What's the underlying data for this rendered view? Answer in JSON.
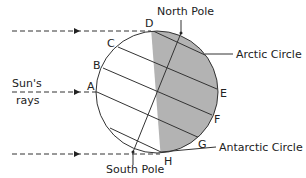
{
  "diagram": {
    "labels": {
      "north_pole": "North Pole",
      "south_pole": "South Pole",
      "arctic_circle": "Arctic Circle",
      "antarctic_circle": "Antarctic Circle",
      "suns_rays_line1": "Sun's",
      "suns_rays_line2": "rays"
    },
    "points": {
      "A": "A",
      "B": "B",
      "C": "C",
      "D": "D",
      "E": "E",
      "F": "F",
      "G": "G",
      "H": "H"
    },
    "colors": {
      "stroke": "#333333",
      "shade": "#b3b3b3",
      "text": "#222222"
    }
  }
}
